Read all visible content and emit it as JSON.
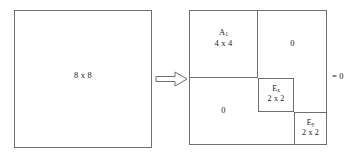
{
  "diagram": {
    "source": {
      "name": "source-matrix",
      "label": "8 x 8",
      "size": "8 x 8"
    },
    "transform": {
      "icon": "right-block-arrow-icon",
      "glyph": "⇒"
    },
    "result": {
      "name": "result-matrix",
      "blocks": [
        {
          "id": "a1",
          "symbol": "A",
          "subscript": "1",
          "size": "4 x 4",
          "position": "top-left"
        },
        {
          "id": "zero-top-right",
          "symbol": "0",
          "subscript": "",
          "size": "",
          "position": "top-right"
        },
        {
          "id": "zero-bottom-left",
          "symbol": "0",
          "subscript": "",
          "size": "",
          "position": "bottom-left"
        },
        {
          "id": "ex",
          "symbol": "E",
          "subscript": "x",
          "size": "2 x 2",
          "position": "middle"
        },
        {
          "id": "ey",
          "symbol": "E",
          "subscript": "y",
          "size": "2 x 2",
          "position": "bottom-right"
        }
      ],
      "annotation": "= 0"
    },
    "colors": {
      "stroke": "#6e6e6e",
      "text": "#1a1a1a",
      "background": "#ffffff"
    }
  }
}
